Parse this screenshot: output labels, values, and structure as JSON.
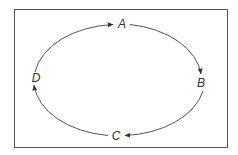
{
  "diagram": {
    "type": "cycle",
    "direction": "clockwise",
    "nodes": [
      {
        "id": "A",
        "label": "A",
        "position": "top"
      },
      {
        "id": "B",
        "label": "B",
        "position": "right"
      },
      {
        "id": "C",
        "label": "C",
        "position": "bottom"
      },
      {
        "id": "D",
        "label": "D",
        "position": "left"
      }
    ],
    "edges": [
      {
        "from": "A",
        "to": "B"
      },
      {
        "from": "B",
        "to": "C"
      },
      {
        "from": "C",
        "to": "D"
      },
      {
        "from": "D",
        "to": "A"
      }
    ],
    "colors": {
      "stroke": "#555555",
      "text": "#333333",
      "background": "#ffffff"
    }
  }
}
